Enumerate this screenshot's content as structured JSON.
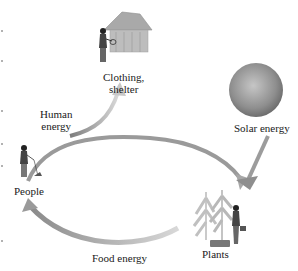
{
  "diagram": {
    "type": "energy-flow-cycle",
    "nodes": {
      "clothing_shelter": {
        "label": "Clothing,\nshelter",
        "line1": "Clothing,",
        "line2": "shelter"
      },
      "solar": {
        "label": "Solar energy"
      },
      "people": {
        "label": "People"
      },
      "plants": {
        "label": "Plants"
      }
    },
    "edges": {
      "human_energy": {
        "label_line1": "Human",
        "label_line2": "energy",
        "from": "people",
        "to": "clothing_shelter"
      },
      "people_to_plants": {
        "from": "people",
        "to": "plants",
        "label": ""
      },
      "solar_to_plants": {
        "from": "solar",
        "to": "plants",
        "label": ""
      },
      "food_energy": {
        "label": "Food energy",
        "from": "plants",
        "to": "people"
      }
    },
    "colors": {
      "arrow_dark": "#8a8a8a",
      "arrow_light": "#d0d0d0",
      "sun_center": "#bdbdbd",
      "sun_edge": "#6e6e6e",
      "text": "#1a1a1a"
    }
  }
}
